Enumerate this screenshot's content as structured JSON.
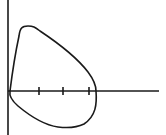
{
  "diagram": {
    "type": "closed-curve-on-axes",
    "colors": {
      "background": "#ffffff",
      "stroke": "#1a1a1a"
    },
    "axes": {
      "y_axis": {
        "x": 8,
        "y_start": 0,
        "y_end": 135
      },
      "x_axis": {
        "y": 91,
        "x_start": 8,
        "x_end": 159
      },
      "ticks": [
        {
          "x": 39
        },
        {
          "x": 63
        },
        {
          "x": 89
        }
      ]
    },
    "curve": {
      "description": "Closed loop crossing x-axis near origin and right of third tick",
      "path": "M10,91 C12,75 16,50 19,36 C20,28 22,26 28,26 C33,26 35,27 40,31 C55,41 75,55 88,72 C94,80 96,86 96,91 C97,104 96,116 84,124 C76,128 66,128 58,127 C44,125 30,116 18,106 C11,100 9,96 10,91 Z"
    }
  }
}
